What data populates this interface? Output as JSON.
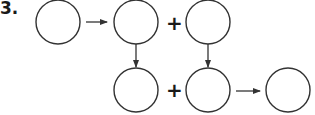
{
  "problem": {
    "number_label": "3.",
    "operators": [
      "+",
      "+"
    ]
  },
  "diagram": {
    "nodes": [
      {
        "id": "c1",
        "cx": 58,
        "cy": 23,
        "r": 22,
        "label": ""
      },
      {
        "id": "c2",
        "cx": 136,
        "cy": 23,
        "r": 22,
        "label": ""
      },
      {
        "id": "c3",
        "cx": 136,
        "cy": 90,
        "r": 22,
        "label": ""
      },
      {
        "id": "c4",
        "cx": 208,
        "cy": 23,
        "r": 22,
        "label": ""
      },
      {
        "id": "c5",
        "cx": 208,
        "cy": 90,
        "r": 22,
        "label": ""
      },
      {
        "id": "c6",
        "cx": 288,
        "cy": 90,
        "r": 22,
        "label": ""
      }
    ],
    "arrows": [
      {
        "from": "c1",
        "to": "c2",
        "direction": "right"
      },
      {
        "from": "c2",
        "to": "c3",
        "direction": "down"
      },
      {
        "from": "c4",
        "to": "c5",
        "direction": "down"
      },
      {
        "from": "c5",
        "to": "c6",
        "direction": "right"
      }
    ],
    "stroke_color": "#333333"
  }
}
